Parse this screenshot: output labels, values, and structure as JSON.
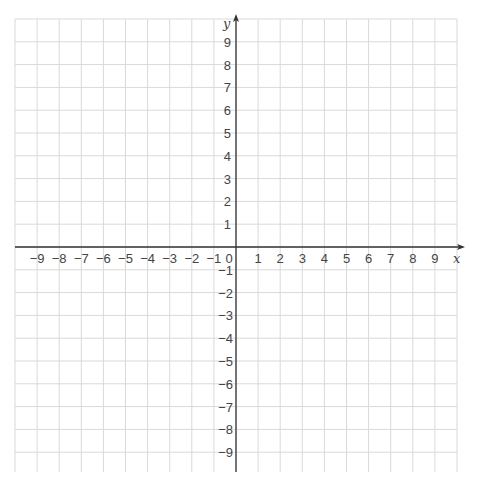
{
  "chart_data": {
    "type": "scatter",
    "title": "",
    "xlabel": "x",
    "ylabel": "y",
    "xlim": [
      -10,
      10
    ],
    "ylim": [
      -10,
      10
    ],
    "grid": true,
    "x_ticks": [
      -9,
      -8,
      -7,
      -6,
      -5,
      -4,
      -3,
      -2,
      -1,
      0,
      1,
      2,
      3,
      4,
      5,
      6,
      7,
      8,
      9
    ],
    "y_ticks": [
      -9,
      -8,
      -7,
      -6,
      -5,
      -4,
      -3,
      -2,
      -1,
      0,
      1,
      2,
      3,
      4,
      5,
      6,
      7,
      8,
      9
    ],
    "x_tick_labels": [
      "−9",
      "−8",
      "−7",
      "−6",
      "−5",
      "−4",
      "−3",
      "−2",
      "−1",
      "0",
      "1",
      "2",
      "3",
      "4",
      "5",
      "6",
      "7",
      "8",
      "9"
    ],
    "y_tick_labels_positive": [
      "1",
      "2",
      "3",
      "4",
      "5",
      "6",
      "7",
      "8",
      "9"
    ],
    "y_tick_labels_negative": [
      "−1",
      "−2",
      "−3",
      "−4",
      "−5",
      "−6",
      "−7",
      "−8",
      "−9"
    ],
    "series": [],
    "legend": null
  },
  "colors": {
    "grid": "#d9d9d9",
    "axis": "#333333",
    "text": "#444444",
    "background": "#ffffff"
  }
}
